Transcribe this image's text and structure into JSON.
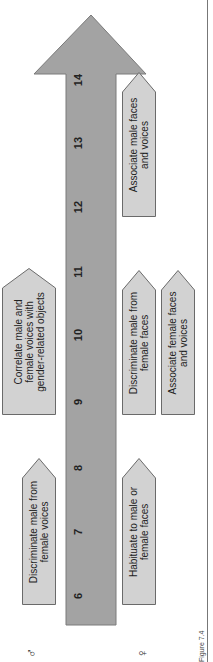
{
  "colors": {
    "arrow_fill": "#a3a3a3",
    "arrow_stroke": "#7a7a7a",
    "box_fill": "#d2d2d2",
    "box_stroke": "#6a6a6a",
    "text": "#222222"
  },
  "timeline": {
    "unit": "months",
    "ticks": [
      "6",
      "7",
      "8",
      "9",
      "10",
      "11",
      "12",
      "13",
      "14"
    ]
  },
  "rows": {
    "male_symbol": "♂",
    "female_symbol": "♀"
  },
  "boxes": {
    "discriminate_voices": "Discriminate male from\nfemale voices",
    "correlate_voices": "Correlate male and\nfemale voices with\ngender-related objects",
    "habituate_faces": "Habituate to male or\nfemale faces",
    "discriminate_faces": "Discriminate male from\nfemale faces",
    "associate_female": "Associate female faces\nand voices",
    "associate_male": "Associate male faces\nand voices"
  },
  "caption": "Figure 7.4"
}
